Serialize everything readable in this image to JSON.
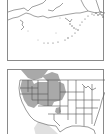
{
  "figure": {
    "type": "range-map",
    "panels": [
      {
        "id": "alaska",
        "region": "Alaska",
        "range_shaded": false
      },
      {
        "id": "usa",
        "region": "Contiguous United States",
        "range_shaded": true,
        "shaded_regions": [
          "Washington (east)",
          "Oregon (east)",
          "Idaho",
          "Montana",
          "Wyoming",
          "Nevada (north)",
          "Utah",
          "Colorado (west)",
          "Southern Alberta/Saskatchewan",
          "New Mexico/Texas panhandle (isolated)"
        ]
      }
    ],
    "colors": {
      "range_fill": "#a9a9a9",
      "border_line": "#555555",
      "coast_line": "#777777",
      "frame": "#8a8a8a",
      "mexico_fill": "#e0e0e0"
    }
  }
}
